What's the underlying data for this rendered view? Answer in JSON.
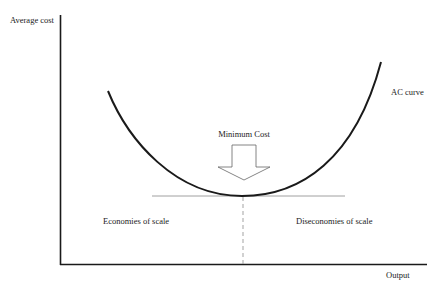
{
  "diagram": {
    "type": "economics-cost-curve",
    "y_axis_label": "Average cost",
    "x_axis_label": "Output",
    "curve_label": "AC curve",
    "minimum_label": "Minimum Cost",
    "left_region_label": "Economies of scale",
    "right_region_label": "Diseconomies of scale",
    "colors": {
      "axis": "#1a1a1a",
      "curve": "#1a1a1a",
      "tangent_line": "#888888",
      "dashed_line": "#999999",
      "arrow_fill": "#ffffff",
      "arrow_stroke": "#666666",
      "text": "#222222"
    }
  }
}
